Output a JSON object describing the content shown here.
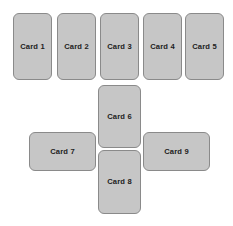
{
  "canvas": {
    "width": 233,
    "height": 226,
    "background_color": "#ffffff"
  },
  "style": {
    "card_fill_color": "#c6c6c6",
    "card_border_color": "#8a8a8a",
    "card_text_color": "#1d1d1d",
    "card_border_radius_px": 6,
    "card_border_width_px": 1.4,
    "card_font_size_px": 7.6
  },
  "layout": {
    "description": "Cross / plus shaped arrangement: a top row of five vertical cards, a vertical center column of two cards below the middle, and one horizontal card on each side of the center column.",
    "groups": [
      {
        "name": "top-row",
        "card_names": [
          "Card 1",
          "Card 2",
          "Card 3",
          "Card 4",
          "Card 5"
        ]
      },
      {
        "name": "center-column",
        "card_names": [
          "Card 6",
          "Card 8"
        ]
      },
      {
        "name": "left-wing",
        "card_names": [
          "Card 7"
        ]
      },
      {
        "name": "right-wing",
        "card_names": [
          "Card 9"
        ]
      }
    ]
  },
  "cards": [
    {
      "id": "card-1",
      "label": "Card 1",
      "orientation": "portrait",
      "x": 13,
      "y": 13,
      "width": 39,
      "height": 67
    },
    {
      "id": "card-2",
      "label": "Card 2",
      "orientation": "portrait",
      "x": 57,
      "y": 13,
      "width": 39,
      "height": 67
    },
    {
      "id": "card-3",
      "label": "Card 3",
      "orientation": "portrait",
      "x": 100,
      "y": 13,
      "width": 39,
      "height": 67
    },
    {
      "id": "card-4",
      "label": "Card 4",
      "orientation": "portrait",
      "x": 143,
      "y": 13,
      "width": 39,
      "height": 67
    },
    {
      "id": "card-5",
      "label": "Card 5",
      "orientation": "portrait",
      "x": 185,
      "y": 13,
      "width": 39,
      "height": 67
    },
    {
      "id": "card-6",
      "label": "Card 6",
      "orientation": "portrait",
      "x": 98,
      "y": 85,
      "width": 43,
      "height": 63
    },
    {
      "id": "card-7",
      "label": "Card 7",
      "orientation": "landscape",
      "x": 29,
      "y": 132,
      "width": 67,
      "height": 39
    },
    {
      "id": "card-8",
      "label": "Card 8",
      "orientation": "portrait",
      "x": 98,
      "y": 150,
      "width": 43,
      "height": 64
    },
    {
      "id": "card-9",
      "label": "Card 9",
      "orientation": "landscape",
      "x": 143,
      "y": 132,
      "width": 67,
      "height": 39
    }
  ]
}
